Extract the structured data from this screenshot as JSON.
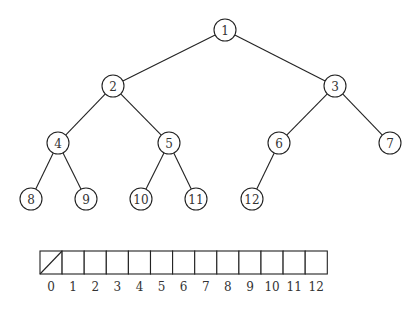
{
  "diagram": {
    "type": "binary-heap-tree",
    "node_radius": 11,
    "nodes": [
      {
        "id": 1,
        "label": "1",
        "x": 225,
        "y": 30
      },
      {
        "id": 2,
        "label": "2",
        "x": 113,
        "y": 86
      },
      {
        "id": 3,
        "label": "3",
        "x": 335,
        "y": 86
      },
      {
        "id": 4,
        "label": "4",
        "x": 58,
        "y": 143
      },
      {
        "id": 5,
        "label": "5",
        "x": 169,
        "y": 143
      },
      {
        "id": 6,
        "label": "6",
        "x": 279,
        "y": 143
      },
      {
        "id": 7,
        "label": "7",
        "x": 390,
        "y": 143
      },
      {
        "id": 8,
        "label": "8",
        "x": 31,
        "y": 199
      },
      {
        "id": 9,
        "label": "9",
        "x": 86,
        "y": 199
      },
      {
        "id": 10,
        "label": "10",
        "x": 141,
        "y": 199
      },
      {
        "id": 11,
        "label": "11",
        "x": 196,
        "y": 199
      },
      {
        "id": 12,
        "label": "12",
        "x": 252,
        "y": 199
      }
    ],
    "edges": [
      [
        1,
        2
      ],
      [
        1,
        3
      ],
      [
        2,
        4
      ],
      [
        2,
        5
      ],
      [
        3,
        6
      ],
      [
        3,
        7
      ],
      [
        4,
        8
      ],
      [
        4,
        9
      ],
      [
        5,
        10
      ],
      [
        5,
        11
      ],
      [
        6,
        12
      ]
    ]
  },
  "array": {
    "x": 40,
    "y": 251,
    "cell_width": 22.1,
    "cell_height": 23,
    "label_y": 287,
    "indices": [
      "0",
      "1",
      "2",
      "3",
      "4",
      "5",
      "6",
      "7",
      "8",
      "9",
      "10",
      "11",
      "12"
    ],
    "slashed_cells": [
      0
    ]
  }
}
